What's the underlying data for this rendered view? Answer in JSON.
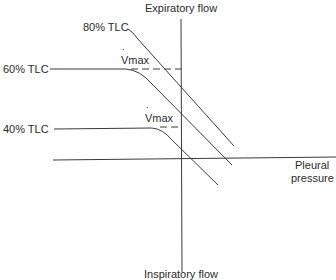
{
  "diagram": {
    "axes": {
      "y_top_label": "Expiratory flow",
      "y_bottom_label": "Inspiratory flow",
      "x_right_label_line1": "Pleural",
      "x_right_label_line2": "pressure"
    },
    "curves": [
      {
        "label": "80% TLC"
      },
      {
        "label": "60% TLC",
        "vmax_label": "Vmax"
      },
      {
        "label": "40% TLC",
        "vmax_label": "Vmax"
      }
    ],
    "colors": {
      "line": "#3a3a3a",
      "text": "#2b2b2b",
      "background": "#ffffff"
    }
  }
}
